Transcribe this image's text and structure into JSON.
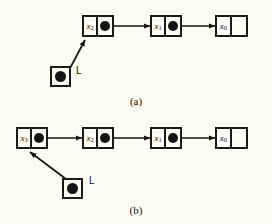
{
  "figure": {
    "background_color": "#fdfdf4",
    "ink_color": "#141414",
    "panels": [
      {
        "id": "a",
        "caption": "(a)",
        "pointer_var": {
          "name": "L",
          "label": "L",
          "icon": "filled-dot",
          "target": "x_2"
        },
        "nodes": [
          {
            "label": "x",
            "subscript": "2",
            "next_field": "pointer",
            "next_icon": "filled-dot",
            "next_target": "x_1"
          },
          {
            "label": "x",
            "subscript": "1",
            "next_field": "pointer",
            "next_icon": "filled-dot",
            "next_target": "x_0"
          },
          {
            "label": "x",
            "subscript": "0",
            "next_field": "null",
            "next_icon": "null-slash",
            "next_target": ""
          }
        ]
      },
      {
        "id": "b",
        "caption": "(b)",
        "pointer_var": {
          "name": "L",
          "label": "L",
          "icon": "filled-dot",
          "target": "x_3"
        },
        "nodes": [
          {
            "label": "x",
            "subscript": "3",
            "next_field": "pointer",
            "next_icon": "filled-dot",
            "next_target": "x_2"
          },
          {
            "label": "x",
            "subscript": "2",
            "next_field": "pointer",
            "next_icon": "filled-dot",
            "next_target": "x_1"
          },
          {
            "label": "x",
            "subscript": "1",
            "next_field": "pointer",
            "next_icon": "filled-dot",
            "next_target": "x_0"
          },
          {
            "label": "x",
            "subscript": "0",
            "next_field": "null",
            "next_icon": "null-slash",
            "next_target": ""
          }
        ]
      }
    ]
  }
}
